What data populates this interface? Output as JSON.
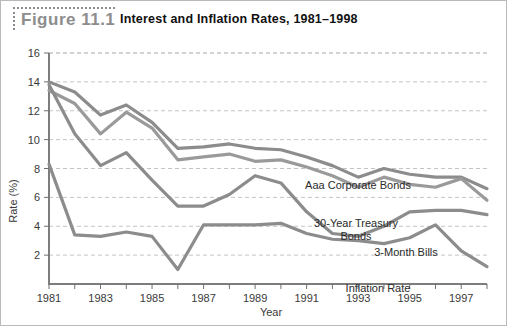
{
  "figure": {
    "label": "Figure 11.1",
    "title": "Interest and Inflation Rates, 1981–1998"
  },
  "axis": {
    "y_title": "Rate (%)",
    "x_title": "Year",
    "y_ticks": [
      "2",
      "4",
      "6",
      "8",
      "10",
      "12",
      "14",
      "16"
    ],
    "x_ticks": [
      "1981",
      "1983",
      "1985",
      "1987",
      "1989",
      "1991",
      "1993",
      "1995",
      "1997"
    ]
  },
  "series_labels": {
    "aaa": "Aaa Corporate Bonds",
    "treasury_line1": "30-Year Treasury",
    "treasury_line2": "Bonds",
    "bills": "3-Month Bills",
    "inflation": "Inflation Rate"
  },
  "colors": {
    "aaa": "#8c8c8c",
    "treasury": "#9a9a9a",
    "bills": "#8c8c8c",
    "inflation": "#8c8c8c",
    "grid": "#c4c4c4",
    "axis": "#7d7d7d",
    "label_gray": "#8d8d8d",
    "title_black": "#111111",
    "frame": "#b9b9b9"
  },
  "chart_data": {
    "type": "line",
    "title": "Interest and Inflation Rates, 1981–1998",
    "xlabel": "Year",
    "ylabel": "Rate (%)",
    "xlim": [
      1981,
      1998
    ],
    "ylim": [
      0,
      16
    ],
    "grid": true,
    "legend": "inline-annotations",
    "x": [
      1981,
      1982,
      1983,
      1984,
      1985,
      1986,
      1987,
      1988,
      1989,
      1990,
      1991,
      1992,
      1993,
      1994,
      1995,
      1996,
      1997,
      1998
    ],
    "series": [
      {
        "name": "Aaa Corporate Bonds",
        "values": [
          14.0,
          13.3,
          11.7,
          12.4,
          11.2,
          9.4,
          9.5,
          9.7,
          9.4,
          9.3,
          8.8,
          8.2,
          7.4,
          8.0,
          7.6,
          7.4,
          7.4,
          6.6
        ]
      },
      {
        "name": "30-Year Treasury Bonds",
        "values": [
          13.4,
          12.5,
          10.4,
          11.9,
          10.8,
          8.6,
          8.8,
          9.0,
          8.5,
          8.6,
          8.1,
          7.5,
          6.7,
          7.4,
          6.9,
          6.7,
          7.3,
          5.8
        ]
      },
      {
        "name": "3-Month Bills",
        "values": [
          13.8,
          10.4,
          8.2,
          9.1,
          7.2,
          5.4,
          5.4,
          6.2,
          7.5,
          7.0,
          5.0,
          3.5,
          3.3,
          4.0,
          5.0,
          5.1,
          5.1,
          4.8
        ]
      },
      {
        "name": "Inflation Rate",
        "values": [
          8.3,
          3.4,
          3.3,
          3.6,
          3.3,
          1.0,
          4.1,
          4.1,
          4.1,
          4.2,
          3.5,
          3.1,
          3.0,
          2.8,
          3.2,
          4.1,
          2.3,
          1.2
        ]
      }
    ]
  }
}
